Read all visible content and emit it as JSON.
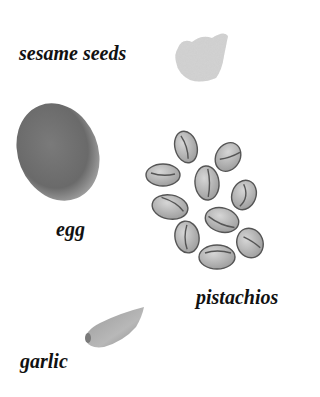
{
  "labels": {
    "sesame": "sesame seeds",
    "egg": "egg",
    "pistachios": "pistachios",
    "garlic": "garlic"
  },
  "colors": {
    "background": "#ffffff",
    "text": "#111111",
    "egg": "#6e6e6e",
    "pistachio": "#bdbdbd",
    "sesame": "#c9c9c9",
    "garlic": "#a9a9a9"
  }
}
